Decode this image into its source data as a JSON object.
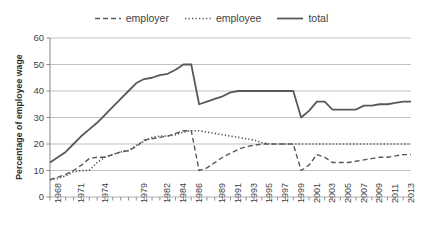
{
  "chart_data": {
    "type": "line",
    "title": "",
    "xlabel": "",
    "ylabel": "Percentage of employee wage",
    "ylim": [
      0,
      60
    ],
    "ytick_labels": [
      "0",
      "10",
      "20",
      "30",
      "40",
      "50",
      "60"
    ],
    "yticks": [
      0,
      10,
      20,
      30,
      40,
      50,
      60
    ],
    "grid": true,
    "legend_position": "top-center",
    "x": [
      1968,
      1969,
      1970,
      1971,
      1972,
      1973,
      1974,
      1975,
      1976,
      1977,
      1978,
      1979,
      1980,
      1981,
      1982,
      1983,
      1984,
      1985,
      1986,
      1987,
      1988,
      1989,
      1990,
      1991,
      1992,
      1993,
      1994,
      1995,
      1996,
      1997,
      1998,
      1999,
      2000,
      2001,
      2002,
      2003,
      2004,
      2005,
      2006,
      2007,
      2008,
      2009,
      2010,
      2011,
      2012,
      2013,
      2014
    ],
    "xtick_labels": [
      "1968",
      "1971",
      "1974",
      "1979",
      "1982",
      "1984",
      "1986",
      "1989",
      "1991",
      "1993",
      "1995",
      "1997",
      "1999",
      "2001",
      "2003",
      "2005",
      "2007",
      "2009",
      "2011",
      "2013"
    ],
    "xtick_label_indices": [
      0,
      3,
      6,
      11,
      14,
      16,
      18,
      21,
      23,
      25,
      27,
      29,
      31,
      33,
      35,
      37,
      39,
      41,
      43,
      45
    ],
    "series": [
      {
        "name": "employer",
        "style": "dashed",
        "color": "#595959",
        "values": [
          6.5,
          7.5,
          8.5,
          10.0,
          12.0,
          14.5,
          15.0,
          15.0,
          16.0,
          17.0,
          17.5,
          19.0,
          21.5,
          22.0,
          22.5,
          23.0,
          24.0,
          25.0,
          25.0,
          10.0,
          11.0,
          13.0,
          15.0,
          16.5,
          18.0,
          19.0,
          19.5,
          20.0,
          20.0,
          20.0,
          20.0,
          20.0,
          10.0,
          12.0,
          16.0,
          15.0,
          13.0,
          13.0,
          13.0,
          13.5,
          14.0,
          14.5,
          15.0,
          15.0,
          15.5,
          16.0,
          16.0
        ]
      },
      {
        "name": "employee",
        "style": "dotted",
        "color": "#595959",
        "values": [
          6.5,
          7.0,
          8.0,
          9.5,
          10.0,
          10.0,
          13.0,
          15.0,
          16.0,
          17.0,
          17.5,
          19.5,
          21.0,
          22.5,
          23.0,
          23.0,
          23.5,
          24.5,
          25.0,
          25.0,
          24.5,
          24.0,
          23.5,
          23.0,
          22.5,
          22.0,
          21.5,
          20.5,
          20.0,
          20.0,
          20.0,
          20.0,
          20.0,
          20.0,
          20.0,
          20.0,
          20.0,
          20.0,
          20.0,
          20.0,
          20.0,
          20.0,
          20.0,
          20.0,
          20.0,
          20.0,
          20.0
        ]
      },
      {
        "name": "total",
        "style": "solid",
        "color": "#595959",
        "values": [
          13.0,
          15.0,
          17.0,
          20.0,
          23.0,
          25.5,
          28.0,
          31.0,
          34.0,
          37.0,
          40.0,
          43.0,
          44.5,
          45.0,
          46.0,
          46.5,
          48.0,
          50.0,
          50.0,
          35.0,
          36.0,
          37.0,
          38.0,
          39.5,
          40.0,
          40.0,
          40.0,
          40.0,
          40.0,
          40.0,
          40.0,
          40.0,
          30.0,
          32.5,
          36.0,
          36.0,
          33.0,
          33.0,
          33.0,
          33.0,
          34.5,
          34.5,
          35.0,
          35.0,
          35.5,
          36.0,
          36.0
        ]
      }
    ]
  },
  "legend": {
    "items": [
      {
        "label": "employer",
        "style": "dashed"
      },
      {
        "label": "employee",
        "style": "dotted"
      },
      {
        "label": "total",
        "style": "solid"
      }
    ]
  },
  "axes": {
    "y_title": "Percentage of employee wage"
  }
}
